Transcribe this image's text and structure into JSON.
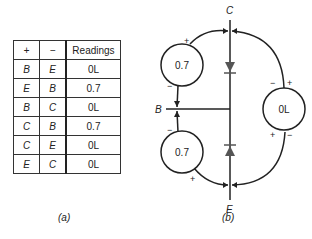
{
  "table": {
    "headers": [
      "+",
      "−",
      "Readings"
    ],
    "rows": [
      [
        "B",
        "E",
        "0L"
      ],
      [
        "E",
        "B",
        "0.7"
      ],
      [
        "B",
        "C",
        "0L"
      ],
      [
        "C",
        "B",
        "0.7"
      ],
      [
        "C",
        "E",
        "0L"
      ],
      [
        "E",
        "C",
        "0L"
      ]
    ]
  },
  "captions": {
    "a": "(a)",
    "b": "(b)"
  },
  "diagram": {
    "terminals": {
      "collector": "C",
      "base": "B",
      "emitter": "E"
    },
    "meters": [
      {
        "id": "top-left",
        "reading": "0.7",
        "plus": "+",
        "minus": "−"
      },
      {
        "id": "bottom-left",
        "reading": "0.7",
        "plus": "+",
        "minus": "−"
      },
      {
        "id": "right",
        "reading": "0L",
        "plus": "+",
        "minus": "−"
      }
    ]
  }
}
